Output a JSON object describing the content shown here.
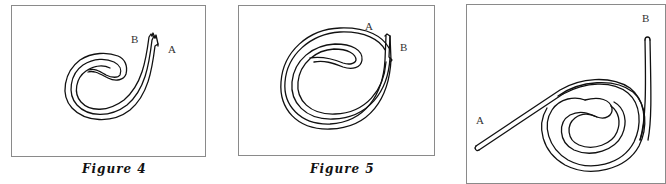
{
  "figures": [
    {
      "id": "figure-4",
      "caption": "Figure 4",
      "labels": {
        "a": "A",
        "b": "B"
      },
      "description": "Strip coiled into a loose single-turn spiral; both ends torn at the top right"
    },
    {
      "id": "figure-5",
      "caption": "Figure 5",
      "labels": {
        "a": "A",
        "b": "B"
      },
      "description": "Strip coiled into a tighter double-turn spiral; torn ends at the upper right"
    },
    {
      "id": "figure-6-partial",
      "caption": "",
      "labels": {
        "a": "A",
        "b": "B"
      },
      "description": "Strip with end A extending straight down-left and end B extending up the right, coiled spiral in the middle"
    }
  ]
}
